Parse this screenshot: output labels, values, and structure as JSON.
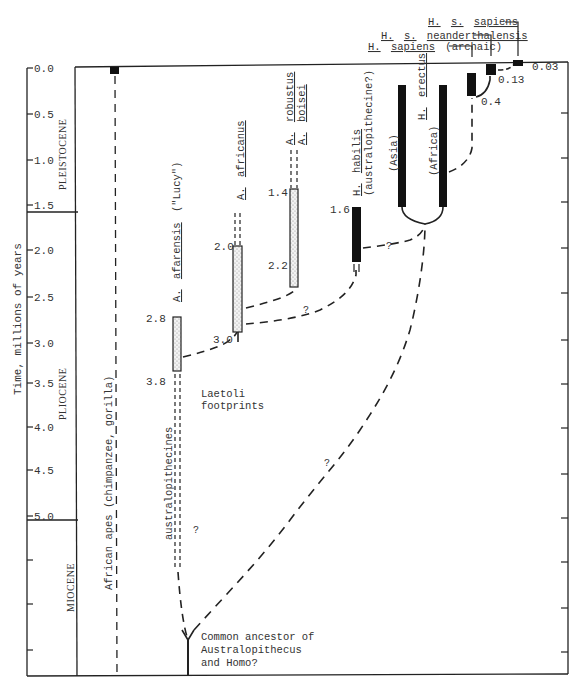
{
  "figure": {
    "y_axis_label": "Time, millions of years",
    "y_ticks": [
      "0.0",
      "0.5",
      "1.0",
      "1.5",
      "2.0",
      "2.5",
      "3.0",
      "3.5",
      "4.0",
      "4.5",
      "5.0"
    ],
    "epochs": [
      {
        "name": "PLEISTOCENE"
      },
      {
        "name": "PLIOCENE"
      },
      {
        "name": "MIOCENE"
      }
    ],
    "lineages": {
      "apes": {
        "label": "African apes (chimpanzee, gorilla)"
      },
      "afarensis": {
        "genus": "A.",
        "species": "afarensis",
        "note": "(\"Lucy\")",
        "top_label": "2.8",
        "bottom_label": "3.8"
      },
      "australopithecines": {
        "label": "australopithecines"
      },
      "africanus": {
        "genus": "A.",
        "species": "africanus",
        "top_label": "2.0",
        "bottom_label": "3.0"
      },
      "robustus": {
        "genus": "A.",
        "species": "robustus"
      },
      "boisei": {
        "genus": "A.",
        "species": "boisei",
        "top_label": "1.4",
        "bottom_label": "2.2"
      },
      "habilis": {
        "genus": "H.",
        "species": "habilis",
        "note": "(australopithecine?)",
        "top_label": "1.6"
      },
      "erectus": {
        "genus": "H.",
        "species": "erectus",
        "asia": "(Asia)",
        "africa": "(Africa)"
      },
      "sapiens_archaic": {
        "label_a": "H.",
        "label_b": "sapiens",
        "label_c": "(archaic)",
        "value": "0.4"
      },
      "neanderthalensis": {
        "label_a": "H.",
        "label_b": "s.",
        "label_c": "neanderthalensis",
        "value": "0.13"
      },
      "sapiens_sapiens": {
        "label_a": "H.",
        "label_b": "s.",
        "label_c": "sapiens",
        "value": "0.03"
      }
    },
    "annotations": {
      "laetoli_1": "Laetoli",
      "laetoli_2": "footprints",
      "ancestor_1": "Common ancestor of",
      "ancestor_2": "Australopithecus",
      "ancestor_3": "and Homo?",
      "question": "?"
    }
  }
}
